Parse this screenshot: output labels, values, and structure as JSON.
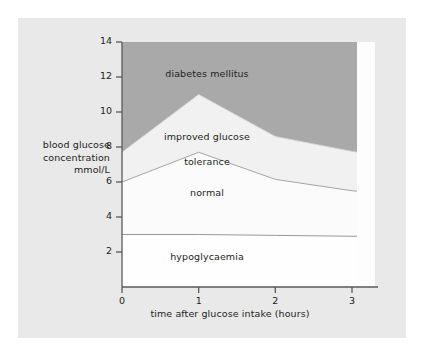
{
  "chart_data": {
    "type": "area",
    "title": "",
    "subtitle": "",
    "xlabel": "time after glucose intake (hours)",
    "ylabel": "blood glucose\nconcentration\nmmol/L",
    "ylabel_lines": [
      "blood glucose",
      "concentration",
      "mmol/L"
    ],
    "xlim": [
      0,
      3.3
    ],
    "ylim": [
      0,
      14
    ],
    "xticks": [
      0,
      1,
      2,
      3
    ],
    "xticklabels": [
      "0",
      "1",
      "2",
      "3"
    ],
    "yticks": [
      2,
      4,
      6,
      8,
      10,
      12,
      14
    ],
    "yticklabels": [
      "2",
      "4",
      "6",
      "8",
      "10",
      "12",
      "14"
    ],
    "grid": false,
    "legend_position": "none",
    "x": [
      0,
      1,
      2,
      3,
      3.3
    ],
    "series": [
      {
        "name": "hypoglycaemia upper boundary",
        "region": "hypoglycaemia",
        "values": [
          3.0,
          3.0,
          2.95,
          2.9,
          2.9
        ],
        "fill_color": "#fdfdfd",
        "line_color": "#8c8c8c"
      },
      {
        "name": "normal upper boundary",
        "region": "normal",
        "values": [
          6.0,
          7.7,
          6.15,
          5.5,
          5.4
        ],
        "fill_color": "#fbfbfb",
        "line_color": "#9a9a9a"
      },
      {
        "name": "improved glucose tolerance upper boundary",
        "region": "improved glucose tolerance",
        "values": [
          7.7,
          11.0,
          8.6,
          7.75,
          7.6
        ],
        "fill_color": "#f2f2f2",
        "line_color": "#d2d2d2"
      },
      {
        "name": "diabetes mellitus region top",
        "region": "diabetes mellitus",
        "values": [
          14.0,
          14.0,
          14.0,
          14.0,
          14.0
        ],
        "fill_color": "#a9a9a9",
        "line_color": "none"
      }
    ],
    "annotations": [
      {
        "text": "diabetes mellitus",
        "x": 1.05,
        "y": 12.4
      },
      {
        "text": "improved glucose\ntolerance",
        "x": 1.05,
        "y": 9.1
      },
      {
        "text": "normal",
        "x": 1.05,
        "y": 5.2
      },
      {
        "text": "hypoglycaemia",
        "x": 1.05,
        "y": 1.9
      }
    ]
  },
  "figure": {
    "panel_background": "#e9e9e9",
    "page_background": "#ffffff",
    "axis_color": "#58595b",
    "text_color": "#231f20"
  },
  "labels": {
    "diabetes_mellitus": "diabetes mellitus",
    "improved_glucose_line1": "improved glucose",
    "improved_glucose_line2": "tolerance",
    "normal": "normal",
    "hypoglycaemia": "hypoglycaemia",
    "y_title_line1": "blood glucose",
    "y_title_line2": "concentration",
    "y_title_line3": "mmol/L",
    "x_title": "time after glucose intake (hours)"
  },
  "ticks": {
    "y": [
      "14",
      "12",
      "10",
      "8",
      "6",
      "4",
      "2"
    ],
    "x": [
      "0",
      "1",
      "2",
      "3"
    ]
  }
}
